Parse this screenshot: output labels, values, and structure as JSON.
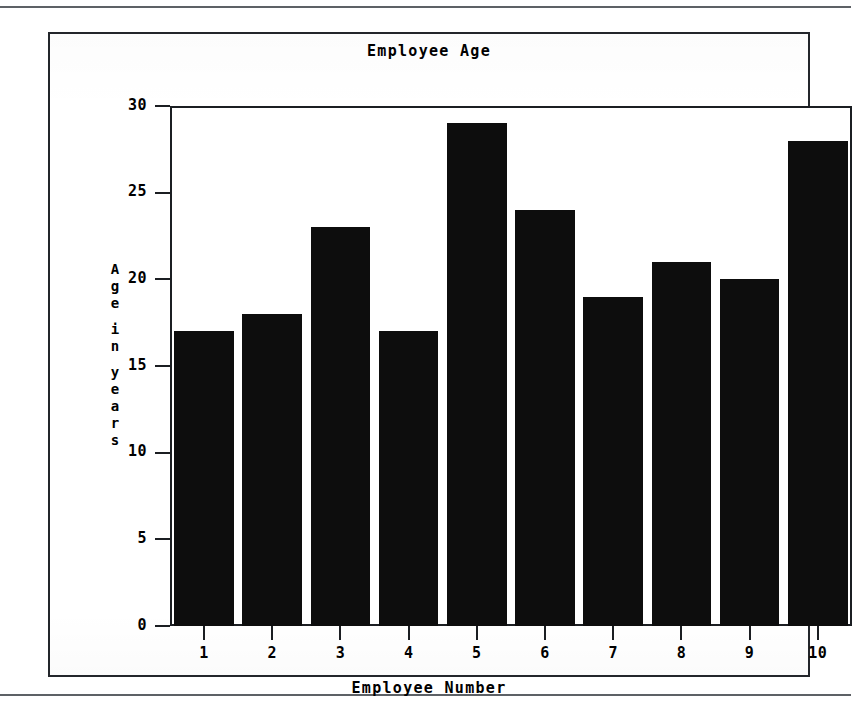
{
  "figure": {
    "title": "Employee Age"
  },
  "chart_data": {
    "type": "bar",
    "title": "Employee Age",
    "xlabel": "Employee Number",
    "ylabel": "Age in years",
    "ylabel_stacked": [
      "A",
      "g",
      "e",
      "",
      "i",
      "n",
      "",
      "y",
      "e",
      "a",
      "r",
      "s"
    ],
    "categories": [
      "1",
      "2",
      "3",
      "4",
      "5",
      "6",
      "7",
      "8",
      "9",
      "10"
    ],
    "values": [
      17,
      18,
      23,
      17,
      29,
      24,
      19,
      21,
      20,
      28
    ],
    "ylim": [
      0,
      30
    ],
    "yticks": [
      30,
      25,
      20,
      15,
      10,
      5,
      0
    ],
    "ytick_labels": [
      "30",
      "25",
      "20",
      "15",
      "10",
      "5",
      "0"
    ],
    "grid": false,
    "legend": "none",
    "bar_color": "#0d0d0d",
    "axis_color": "#1b1e22",
    "background": "#ffffff"
  }
}
